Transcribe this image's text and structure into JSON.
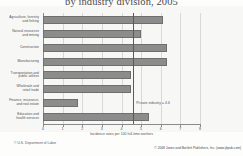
{
  "chart_data": {
    "type": "bar",
    "orientation": "horizontal",
    "title": "by industry division, 2005",
    "xlabel": "Incidence rates per 100 full-time workers",
    "ylabel": "",
    "xlim": [
      0,
      8
    ],
    "xticks": [
      "0",
      "1",
      "2",
      "3",
      "4",
      "5",
      "6",
      "7",
      "8"
    ],
    "grid": true,
    "legend": "none",
    "categories": [
      "Agriculture, forestry\nand fishing",
      "Natural resources\nand mining",
      "Construction",
      "Manufacturing",
      "Transportation and\npublic utilities",
      "Wholesale and\nretail trade",
      "Finance, insurance,\nand real estate",
      "Education and\nhealth services"
    ],
    "values": [
      6.1,
      5.0,
      6.3,
      6.3,
      4.5,
      4.5,
      1.8,
      5.4
    ],
    "bar_color": "#8c8c8c",
    "annotations": [
      {
        "name": "private-industry-reference",
        "label": "Private industry = 4.6",
        "value": 4.6
      }
    ]
  },
  "footer": {
    "source": "© U.S. Department of Labor",
    "copyright": "© 2008 Jones and Bartlett Publishers, Inc. (www.jbpub.com)"
  }
}
